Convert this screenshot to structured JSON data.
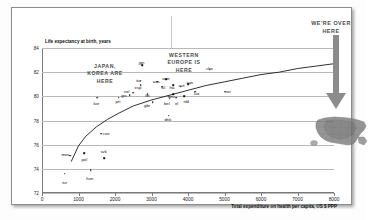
{
  "chart_data": {
    "type": "scatter",
    "title": "",
    "xlabel": "Total expenditure on health per capita, US $ PPP",
    "ylabel": "Life expectancy at birth, years",
    "xlim": [
      0,
      8000
    ],
    "ylim": [
      72,
      84
    ],
    "xticks": [
      0,
      1000,
      2000,
      3000,
      4000,
      5000,
      6000,
      7000,
      8000
    ],
    "yticks": [
      72,
      74,
      76,
      78,
      80,
      82,
      84
    ],
    "grid": "horizontal",
    "legend": "none",
    "point_color": "#111111",
    "trend": {
      "type": "logarithmic",
      "label": "fitted trend curve",
      "points": [
        [
          800,
          74.6
        ],
        [
          1000,
          75.9
        ],
        [
          1200,
          76.7
        ],
        [
          1500,
          77.5
        ],
        [
          1800,
          78.1
        ],
        [
          2100,
          78.6
        ],
        [
          2500,
          79.2
        ],
        [
          3000,
          79.7
        ],
        [
          3500,
          80.1
        ],
        [
          4000,
          80.5
        ],
        [
          4500,
          80.9
        ],
        [
          5000,
          81.2
        ],
        [
          5500,
          81.5
        ],
        [
          6000,
          81.8
        ],
        [
          6500,
          82.0
        ],
        [
          7000,
          82.3
        ],
        [
          7500,
          82.5
        ],
        [
          8000,
          82.7
        ]
      ]
    },
    "points": [
      {
        "code": "tur",
        "x": 620,
        "y": 73.6,
        "lx": 620,
        "ly": 72.9
      },
      {
        "code": "hun",
        "x": 1330,
        "y": 73.9,
        "lx": 1310,
        "ly": 73.2
      },
      {
        "code": "mex",
        "x": 770,
        "y": 75.1,
        "lx": 640,
        "ly": 75.2
      },
      {
        "code": "pol",
        "x": 1150,
        "y": 75.3,
        "lx": 1160,
        "ly": 74.8
      },
      {
        "code": "svk",
        "x": 1700,
        "y": 74.9,
        "lx": 1690,
        "ly": 75.4
      },
      {
        "code": "cze",
        "x": 1630,
        "y": 76.9,
        "lx": 1760,
        "ly": 76.9
      },
      {
        "code": "kor",
        "x": 1520,
        "y": 79.9,
        "lx": 1490,
        "ly": 79.4
      },
      {
        "code": "prt",
        "x": 2100,
        "y": 79.9,
        "lx": 2080,
        "ly": 79.6
      },
      {
        "code": "grc",
        "x": 2400,
        "y": 80.1,
        "lx": 2250,
        "ly": 80.1
      },
      {
        "code": "nzl",
        "x": 2500,
        "y": 80.3,
        "lx": 2320,
        "ly": 80.4
      },
      {
        "code": "esp",
        "x": 2700,
        "y": 80.9,
        "lx": 2630,
        "ly": 80.7
      },
      {
        "code": "ita",
        "x": 2700,
        "y": 81.3,
        "lx": 2640,
        "ly": 81.3
      },
      {
        "code": "jpn",
        "x": 2750,
        "y": 82.6,
        "lx": 2730,
        "ly": 82.8
      },
      {
        "code": "fin",
        "x": 2900,
        "y": 80.2,
        "lx": 2890,
        "ly": 80.1
      },
      {
        "code": "aus",
        "x": 3150,
        "y": 81.2,
        "lx": 3130,
        "ly": 81.2
      },
      {
        "code": "isl",
        "x": 3300,
        "y": 80.8,
        "lx": 3320,
        "ly": 80.7
      },
      {
        "code": "gbr",
        "x": 3030,
        "y": 79.5,
        "lx": 2880,
        "ly": 79.2
      },
      {
        "code": "bel",
        "x": 3500,
        "y": 79.8,
        "lx": 3420,
        "ly": 79.4
      },
      {
        "code": "irl",
        "x": 3680,
        "y": 79.9,
        "lx": 3690,
        "ly": 79.4
      },
      {
        "code": "nld",
        "x": 3900,
        "y": 80.0,
        "lx": 3950,
        "ly": 79.6
      },
      {
        "code": "dnk",
        "x": 3470,
        "y": 78.4,
        "lx": 3450,
        "ly": 78.1
      },
      {
        "code": "swe",
        "x": 3400,
        "y": 81.4,
        "lx": 3390,
        "ly": 81.5
      },
      {
        "code": "fra",
        "x": 3600,
        "y": 80.9,
        "lx": 3560,
        "ly": 80.7
      },
      {
        "code": "aut",
        "x": 3800,
        "y": 80.8,
        "lx": 3820,
        "ly": 80.9
      },
      {
        "code": "deu",
        "x": 3600,
        "y": 80.2,
        "lx": 3540,
        "ly": 80.0
      },
      {
        "code": "can",
        "x": 4000,
        "y": 81.0,
        "lx": 4050,
        "ly": 81.1
      },
      {
        "code": "lux",
        "x": 4200,
        "y": 80.4,
        "lx": 4240,
        "ly": 80.2
      },
      {
        "code": "che",
        "x": 4600,
        "y": 82.2,
        "lx": 4590,
        "ly": 82.3
      },
      {
        "code": "nor",
        "x": 5000,
        "y": 80.4,
        "lx": 5090,
        "ly": 80.4
      }
    ],
    "annotations": [
      {
        "id": "japan-korea",
        "text": "JAPAN,\nKOREA ARE\nHERE"
      },
      {
        "id": "western-europe",
        "text": "WESTERN\nEUROPE IS\nHERE"
      },
      {
        "id": "us-callout",
        "text": "WE'RE OVER\nHERE"
      }
    ]
  },
  "annotations": {
    "japan_korea": {
      "line1": "JAPAN,",
      "line2": "KOREA ARE",
      "line3": "HERE"
    },
    "western_europe": {
      "line1": "WESTERN",
      "line2": "EUROPE IS",
      "line3": "HERE"
    },
    "us_callout": {
      "line1": "WE'RE OVER",
      "line2": "HERE"
    }
  },
  "axes": {
    "ylabel": "Life expectancy at birth, years",
    "xlabel": "Total expenditure on health per capita, US $ PPP"
  },
  "colors": {
    "arrow": "#8c8c8c",
    "annotation_text": "#4a4a4a",
    "grid": "#b9b9b9",
    "axis": "#7a7a7a",
    "point": "#111111"
  }
}
